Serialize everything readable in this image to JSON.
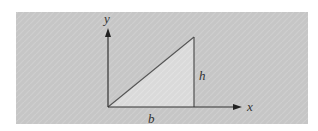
{
  "diagram": {
    "type": "right-triangle-on-axes",
    "panel": {
      "x": 16,
      "y": 12,
      "width": 292,
      "height": 112,
      "fill": "#c8c8c8"
    },
    "colors": {
      "background": "#ffffff",
      "panel": "#c8c8c8",
      "triangle_fill": "#dcdcdc",
      "line": "#444444",
      "text": "#333333"
    },
    "origin": {
      "x": 108,
      "y": 107
    },
    "x_axis": {
      "label": "x",
      "end_x": 241
    },
    "y_axis": {
      "label": "y",
      "end_y": 29
    },
    "triangle": {
      "vertices": [
        [
          108,
          107
        ],
        [
          194,
          107
        ],
        [
          194,
          37
        ]
      ],
      "base_label": "b",
      "height_label": "h"
    }
  }
}
